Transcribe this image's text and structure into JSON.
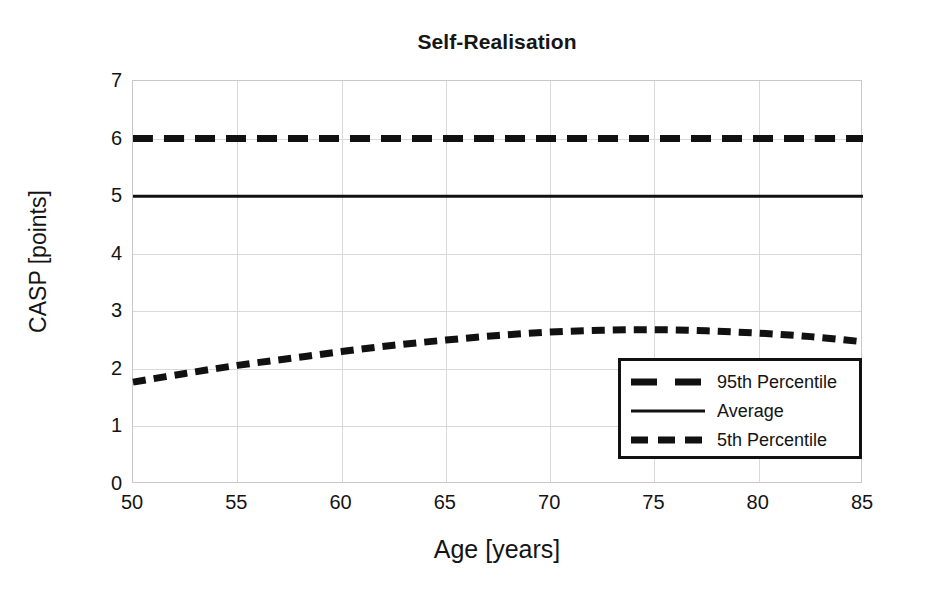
{
  "chart_data": {
    "type": "line",
    "title": "Self-Realisation",
    "xlabel": "Age [years]",
    "ylabel": "CASP [points]",
    "xlim": [
      50,
      85
    ],
    "ylim": [
      0,
      7
    ],
    "xticks": [
      50,
      55,
      60,
      65,
      70,
      75,
      80,
      85
    ],
    "yticks": [
      0,
      1,
      2,
      3,
      4,
      5,
      6,
      7
    ],
    "grid": true,
    "legend_position": "lower right",
    "x": [
      50,
      52.5,
      55,
      57.5,
      60,
      62.5,
      65,
      67.5,
      70,
      72.5,
      75,
      77.5,
      80,
      82.5,
      85
    ],
    "series": [
      {
        "name": "95th Percentile",
        "style": "long-dashed",
        "color": "#111111",
        "values": [
          6.0,
          6.0,
          6.0,
          6.0,
          6.0,
          6.0,
          6.0,
          6.0,
          6.0,
          6.0,
          6.0,
          6.0,
          6.0,
          6.0,
          6.0
        ]
      },
      {
        "name": "Average",
        "style": "solid",
        "color": "#111111",
        "values": [
          5.0,
          5.0,
          5.0,
          5.0,
          5.0,
          5.0,
          5.0,
          5.0,
          5.0,
          5.0,
          5.0,
          5.0,
          5.0,
          5.0,
          5.0
        ]
      },
      {
        "name": "5th Percentile",
        "style": "short-dashed",
        "color": "#111111",
        "values": [
          1.77,
          1.92,
          2.06,
          2.18,
          2.3,
          2.41,
          2.5,
          2.58,
          2.64,
          2.67,
          2.68,
          2.66,
          2.62,
          2.56,
          2.47
        ]
      }
    ]
  },
  "legend": {
    "items": [
      {
        "label": "95th Percentile"
      },
      {
        "label": "Average"
      },
      {
        "label": "5th Percentile"
      }
    ]
  }
}
